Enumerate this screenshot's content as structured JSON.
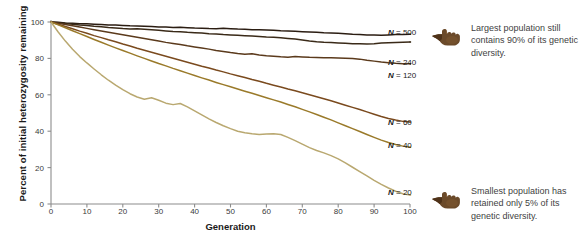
{
  "chart_data": {
    "type": "line",
    "title": "",
    "xlabel": "Generation",
    "ylabel": "Percent of initial heterozygosity remaining",
    "xlim": [
      0,
      100
    ],
    "ylim": [
      0,
      100
    ],
    "xticks": [
      0,
      10,
      20,
      30,
      40,
      50,
      60,
      70,
      80,
      90,
      100
    ],
    "yticks": [
      0,
      20,
      40,
      60,
      80,
      100
    ],
    "grid": false,
    "legend_position": "right-inline",
    "x": [
      0,
      2,
      4,
      6,
      8,
      10,
      12,
      14,
      16,
      18,
      20,
      22,
      24,
      26,
      28,
      30,
      32,
      34,
      36,
      38,
      40,
      42,
      44,
      46,
      48,
      50,
      52,
      54,
      56,
      58,
      60,
      62,
      64,
      66,
      68,
      70,
      72,
      74,
      76,
      78,
      80,
      82,
      84,
      86,
      88,
      90,
      92,
      94,
      96,
      98,
      100
    ],
    "series": [
      {
        "name": "N = 500",
        "color": "#2b1d12",
        "values": [
          100,
          99.8,
          99.5,
          99.3,
          99.1,
          99.0,
          98.8,
          98.6,
          98.4,
          98.3,
          98.1,
          97.9,
          97.8,
          97.7,
          97.5,
          97.3,
          97.2,
          97.0,
          97.1,
          96.9,
          96.7,
          96.6,
          96.4,
          96.3,
          96.5,
          96.3,
          96.1,
          96.0,
          95.8,
          95.7,
          95.6,
          95.4,
          95.2,
          95.1,
          94.9,
          94.7,
          94.5,
          94.3,
          94.1,
          94.0,
          93.8,
          93.6,
          93.3,
          93.1,
          92.9,
          92.8,
          92.7,
          92.9,
          93.1,
          93.2,
          93.3
        ]
      },
      {
        "name": "N = 240",
        "color": "#3a2a18",
        "values": [
          100,
          99.6,
          99.2,
          98.8,
          98.4,
          98.1,
          97.7,
          97.4,
          97.0,
          96.7,
          96.4,
          96.2,
          96.3,
          96.0,
          95.7,
          95.4,
          95.1,
          94.8,
          94.6,
          94.3,
          94.1,
          93.9,
          93.6,
          93.4,
          93.1,
          92.9,
          92.7,
          92.5,
          92.3,
          92.1,
          91.8,
          91.6,
          91.3,
          91.0,
          90.6,
          90.1,
          89.6,
          89.2,
          88.9,
          88.7,
          88.5,
          88.3,
          88.1,
          88.0,
          87.9,
          88.1,
          88.4,
          88.6,
          88.8,
          88.9,
          89.0
        ]
      },
      {
        "name": "N = 120",
        "color": "#5b3a1c",
        "values": [
          100,
          99.3,
          98.6,
          97.9,
          97.2,
          96.5,
          95.8,
          95.1,
          94.4,
          93.7,
          93.0,
          92.3,
          91.6,
          90.9,
          90.2,
          89.5,
          88.8,
          88.2,
          87.6,
          86.9,
          86.3,
          85.7,
          85.1,
          84.4,
          83.8,
          83.2,
          82.7,
          82.3,
          82.5,
          81.9,
          81.5,
          81.2,
          80.9,
          80.7,
          81.0,
          80.8,
          80.6,
          80.5,
          80.4,
          80.3,
          80.2,
          80.1,
          80.0,
          79.6,
          79.0,
          78.5,
          78.0,
          77.6,
          77.3,
          77.1,
          77.0
        ]
      },
      {
        "name": "N = 60",
        "color": "#7a4a1e",
        "values": [
          100,
          98.8,
          97.5,
          96.3,
          95.0,
          93.8,
          92.5,
          91.4,
          90.2,
          89.1,
          87.9,
          86.8,
          85.6,
          84.5,
          83.4,
          82.3,
          81.2,
          80.1,
          79.0,
          77.9,
          76.8,
          75.7,
          74.7,
          73.6,
          72.6,
          71.5,
          70.5,
          69.5,
          68.4,
          67.4,
          66.3,
          65.3,
          64.3,
          63.2,
          62.2,
          61.1,
          60.0,
          58.9,
          57.8,
          56.7,
          55.5,
          54.3,
          53.1,
          51.9,
          50.6,
          49.3,
          48.1,
          47.0,
          46.1,
          45.4,
          45.0
        ]
      },
      {
        "name": "N = 40",
        "color": "#9a7a2a",
        "values": [
          100,
          98.4,
          96.8,
          95.2,
          93.6,
          92.0,
          90.4,
          88.9,
          87.3,
          85.8,
          84.3,
          82.9,
          81.4,
          80.0,
          78.6,
          77.2,
          75.9,
          74.5,
          73.2,
          71.9,
          70.6,
          69.3,
          68.1,
          66.8,
          65.6,
          64.4,
          63.2,
          62.0,
          60.8,
          59.6,
          58.4,
          57.2,
          56.0,
          54.7,
          53.4,
          52.0,
          50.6,
          49.2,
          47.7,
          46.2,
          44.6,
          43.0,
          41.4,
          39.8,
          38.2,
          36.6,
          35.1,
          33.8,
          32.7,
          31.8,
          31.2
        ]
      },
      {
        "name": "N = 20",
        "color": "#b9a870",
        "values": [
          100,
          94.5,
          89.5,
          85.0,
          81.0,
          77.5,
          74.2,
          71.0,
          68.0,
          65.3,
          62.8,
          60.6,
          58.8,
          57.6,
          58.4,
          57.0,
          55.4,
          54.6,
          55.2,
          53.4,
          51.2,
          49.0,
          46.8,
          44.8,
          43.0,
          41.4,
          40.0,
          39.2,
          38.6,
          38.2,
          38.4,
          38.6,
          38.2,
          36.6,
          34.8,
          32.9,
          31.0,
          29.4,
          28.1,
          26.6,
          24.8,
          22.6,
          20.2,
          17.8,
          15.4,
          13.0,
          10.8,
          8.8,
          7.0,
          5.6,
          5.0
        ]
      }
    ]
  },
  "series_labels": [
    {
      "label": "N = 500",
      "n": "N",
      "rest": " = 500"
    },
    {
      "label": "N = 240",
      "n": "N",
      "rest": " = 240"
    },
    {
      "label": "N = 120",
      "n": "N",
      "rest": " = 120"
    },
    {
      "label": "N = 60",
      "n": "N",
      "rest": " = 60"
    },
    {
      "label": "N = 40",
      "n": "N",
      "rest": " = 40"
    },
    {
      "label": "N = 20",
      "n": "N",
      "rest": " = 20"
    }
  ],
  "callouts": [
    {
      "text": "Largest population still contains 90% of its genetic diversity."
    },
    {
      "text": "Smallest population has retained only 5% of its genetic diversity."
    }
  ],
  "colors": {
    "axis": "#8c8c8c",
    "text": "#1a1a1a",
    "callout_text": "#3f3f3f",
    "hand": "#6b4a2a"
  }
}
